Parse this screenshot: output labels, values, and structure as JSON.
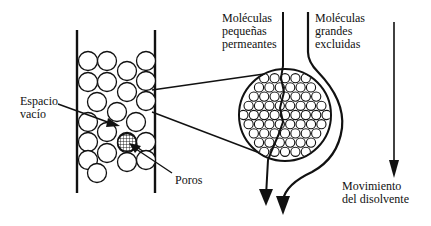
{
  "diagram": {
    "labels": {
      "void_space": [
        "Espacio",
        "vacío"
      ],
      "pores": "Poros",
      "small_molecules": [
        "Moléculas",
        "pequeñas",
        "permeantes"
      ],
      "large_molecules": [
        "Moléculas",
        "grandes",
        "excluidas"
      ],
      "solvent_movement": [
        "Movimiento",
        "del disolvente"
      ]
    },
    "colors": {
      "ink": "#111111",
      "background": "#ffffff"
    },
    "column": {
      "left_wall_x": 77,
      "right_wall_x": 155,
      "top_y": 30,
      "bottom_y": 193,
      "bead_radius": 9.5,
      "beads": [
        [
          88,
          61
        ],
        [
          107,
          61
        ],
        [
          146,
          61
        ],
        [
          88,
          82
        ],
        [
          107,
          82
        ],
        [
          127,
          71
        ],
        [
          146,
          81
        ],
        [
          97,
          102
        ],
        [
          127,
          92
        ],
        [
          146,
          101
        ],
        [
          88,
          122
        ],
        [
          117,
          112
        ],
        [
          136,
          122
        ],
        [
          88,
          142
        ],
        [
          107,
          132
        ],
        [
          127,
          142
        ],
        [
          146,
          142
        ],
        [
          88,
          160
        ],
        [
          107,
          153
        ],
        [
          127,
          162
        ],
        [
          146,
          160
        ],
        [
          97,
          173
        ]
      ],
      "porous_bead": [
        127,
        143
      ]
    },
    "magnified_bead": {
      "cx": 285,
      "cy": 115,
      "r": 46
    }
  }
}
